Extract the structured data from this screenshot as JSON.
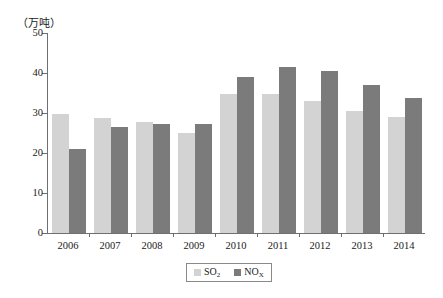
{
  "chart_data": {
    "type": "bar",
    "title": "",
    "unit_label": "（万吨）",
    "xlabel": "",
    "ylabel": "",
    "ylim": [
      0,
      50
    ],
    "yticks": [
      0,
      10,
      20,
      30,
      40,
      50
    ],
    "grid": false,
    "legend_position": "bottom-center",
    "categories": [
      "2006",
      "2007",
      "2008",
      "2009",
      "2010",
      "2011",
      "2012",
      "2013",
      "2014"
    ],
    "series": [
      {
        "name": "SO2",
        "label_html": "SO<sub>2</sub>",
        "color": "#d3d3d3",
        "values": [
          29.8,
          28.7,
          27.7,
          25.0,
          34.8,
          34.7,
          33.0,
          30.6,
          28.9
        ]
      },
      {
        "name": "NOx",
        "label_html": "NO<sub>X</sub>",
        "color": "#7b7b7b",
        "values": [
          21.1,
          26.6,
          27.3,
          27.2,
          38.9,
          41.4,
          40.6,
          37.0,
          33.8
        ]
      }
    ]
  },
  "legend": {
    "items": [
      {
        "label": "SO",
        "sub": "2",
        "color": "#d3d3d3"
      },
      {
        "label": "NO",
        "sub": "X",
        "color": "#7b7b7b"
      }
    ]
  }
}
